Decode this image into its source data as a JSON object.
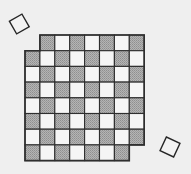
{
  "diagram": {
    "board": {
      "rows": 8,
      "cols": 8,
      "origin_x": 25,
      "origin_y": 35,
      "cell_w": 14.9,
      "cell_h": 15.7,
      "dark_rule": "row+col odd (1-indexed)",
      "removed_cells": [
        {
          "row": 1,
          "col": 1,
          "color": "light"
        },
        {
          "row": 8,
          "col": 8,
          "color": "light"
        }
      ],
      "colors": {
        "dark": "#a6a6a6",
        "light": "#f5f5f5",
        "line": "#2e2e2e",
        "background": "#efefef"
      }
    },
    "removed_squares": [
      {
        "name": "removed-corner-top-left",
        "cx": 19.3,
        "cy": 24,
        "size": 14.5,
        "rotation": -30
      },
      {
        "name": "removed-corner-bottom-right",
        "cx": 170,
        "cy": 147,
        "size": 15,
        "rotation": 25
      }
    ]
  }
}
